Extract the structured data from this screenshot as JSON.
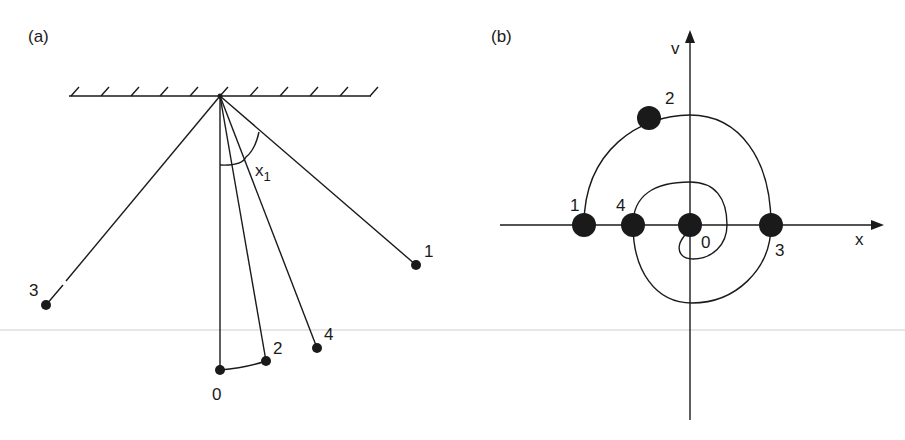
{
  "panel_a": {
    "label": "(a)",
    "angle_label": "x",
    "angle_subscript": "1",
    "bobs": [
      {
        "id": "0",
        "label": "0"
      },
      {
        "id": "1",
        "label": "1"
      },
      {
        "id": "2",
        "label": "2"
      },
      {
        "id": "3",
        "label": "3"
      },
      {
        "id": "4",
        "label": "4"
      }
    ]
  },
  "panel_b": {
    "label": "(b)",
    "x_axis_label": "x",
    "y_axis_label": "v",
    "points": [
      {
        "id": "0",
        "label": "0"
      },
      {
        "id": "1",
        "label": "1"
      },
      {
        "id": "2",
        "label": "2"
      },
      {
        "id": "3",
        "label": "3"
      },
      {
        "id": "4",
        "label": "4"
      }
    ]
  },
  "colors": {
    "ink": "#1a1a1a",
    "background": "#ffffff"
  }
}
